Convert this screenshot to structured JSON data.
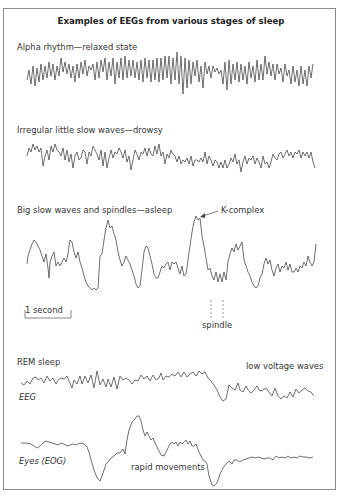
{
  "figure": {
    "title": "Examples of EEGs from various stages of sleep",
    "traces": [
      {
        "label": "Alpha rhythm—relaxed state"
      },
      {
        "label": "Irregular little slow waves—drowsy"
      },
      {
        "label": "Big slow waves and spindles—asleep"
      },
      {
        "label": "REM sleep"
      }
    ],
    "annotations": {
      "k_complex": "K-complex",
      "spindle": "spindle",
      "scale_bar": "1 second",
      "low_voltage": "low voltage waves",
      "eeg": "EEG",
      "eog": "Eyes (EOG)",
      "rapid_movements": "rapid movements"
    },
    "colors": {
      "trace": "#4a4a4a",
      "border": "#8a8a8a",
      "text": "#333333"
    }
  }
}
